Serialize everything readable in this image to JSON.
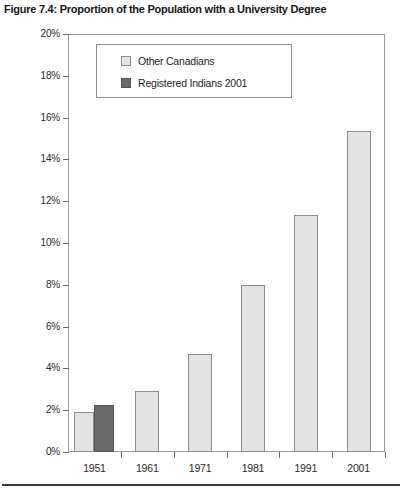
{
  "figure": {
    "title": "Figure 7.4: Proportion of the Population with a University Degree"
  },
  "legend": {
    "items": [
      {
        "label": "Other Canadians",
        "color": "#e3e3e3",
        "swatch": "other"
      },
      {
        "label": "Registered Indians 2001",
        "color": "#6b6b6b",
        "swatch": "registered"
      }
    ]
  },
  "chart_data": {
    "type": "bar",
    "title": "Figure 7.4: Proportion of the Population with a University Degree",
    "xlabel": "",
    "ylabel": "",
    "categories": [
      "1951",
      "1961",
      "1971",
      "1981",
      "1991",
      "2001"
    ],
    "series": [
      {
        "name": "Other Canadians",
        "color": "#e3e3e3",
        "values": [
          1.9,
          2.9,
          4.7,
          8.0,
          11.35,
          15.35
        ]
      },
      {
        "name": "Registered Indians 2001",
        "color": "#6b6b6b",
        "values": [
          2.25,
          null,
          null,
          null,
          null,
          null
        ]
      }
    ],
    "ylim": [
      0,
      20
    ],
    "yticks": [
      0,
      2,
      4,
      6,
      8,
      10,
      12,
      14,
      16,
      18,
      20
    ],
    "ytick_labels": [
      "0%",
      "2%",
      "4%",
      "6%",
      "8%",
      "10%",
      "12%",
      "14%",
      "16%",
      "18%",
      "20%"
    ],
    "grid": false,
    "legend_position": "upper-left-inside"
  },
  "axes": {
    "y_ticks": [
      {
        "label": "20%",
        "value": 20
      },
      {
        "label": "18%",
        "value": 18
      },
      {
        "label": "16%",
        "value": 16
      },
      {
        "label": "14%",
        "value": 14
      },
      {
        "label": "12%",
        "value": 12
      },
      {
        "label": "10%",
        "value": 10
      },
      {
        "label": "8%",
        "value": 8
      },
      {
        "label": "6%",
        "value": 6
      },
      {
        "label": "4%",
        "value": 4
      },
      {
        "label": "2%",
        "value": 2
      },
      {
        "label": "0%",
        "value": 0
      }
    ],
    "x_ticks": [
      {
        "label": "1951"
      },
      {
        "label": "1961"
      },
      {
        "label": "1971"
      },
      {
        "label": "1981"
      },
      {
        "label": "1991"
      },
      {
        "label": "2001"
      }
    ]
  }
}
